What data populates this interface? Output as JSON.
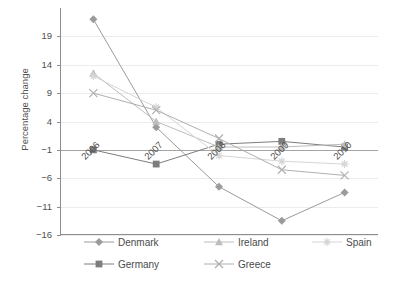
{
  "chart_data": {
    "type": "line",
    "title": "",
    "xlabel": "",
    "ylabel": "Percentage change",
    "categories": [
      "2006",
      "2007",
      "2008",
      "2009",
      "2010"
    ],
    "yticks": [
      19,
      14,
      9,
      4,
      -1,
      -6,
      -11,
      -16
    ],
    "ylim": [
      -16,
      24
    ],
    "grid": true,
    "legend_position": "bottom",
    "series": [
      {
        "name": "Denmark",
        "marker": "diamond",
        "color": "#9b9b9b",
        "values": [
          22.0,
          3.0,
          -7.5,
          -13.5,
          -8.5
        ]
      },
      {
        "name": "Germany",
        "marker": "square",
        "color": "#7d7d7d",
        "values": [
          -1.0,
          -3.5,
          0.0,
          0.5,
          -0.5
        ]
      },
      {
        "name": "Ireland",
        "marker": "triangle",
        "color": "#bdbdbd",
        "values": [
          12.5,
          4.0,
          -0.5,
          -0.5,
          0.0
        ]
      },
      {
        "name": "Spain",
        "marker": "asterisk",
        "color": "#d6d6d6",
        "values": [
          12.0,
          6.5,
          -2.0,
          -3.0,
          -3.5
        ]
      },
      {
        "name": "Greece",
        "marker": "cross",
        "color": "#b0b0b0",
        "values": [
          9.0,
          6.0,
          1.0,
          -4.5,
          -5.5
        ]
      }
    ]
  },
  "axis": {
    "y_title": "Percentage change",
    "y_tick_labels": [
      "19",
      "14",
      "9",
      "4",
      "−1",
      "−6",
      "−11",
      "−16"
    ],
    "x_tick_labels": [
      "2006",
      "2007",
      "2008",
      "2009",
      "2010"
    ]
  },
  "legend": {
    "items": [
      {
        "label": "Denmark",
        "marker": "diamond-marker-icon"
      },
      {
        "label": "Ireland",
        "marker": "triangle-marker-icon"
      },
      {
        "label": "Spain",
        "marker": "asterisk-marker-icon"
      },
      {
        "label": "Germany",
        "marker": "square-marker-icon"
      },
      {
        "label": "Greece",
        "marker": "cross-marker-icon"
      }
    ]
  }
}
